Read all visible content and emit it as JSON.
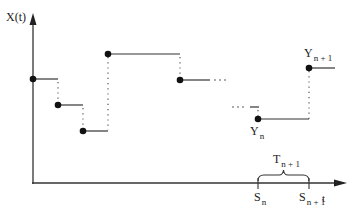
{
  "diagram": {
    "type": "step-process",
    "axes": {
      "y_label": "X(t)",
      "x_label": "t"
    },
    "colors": {
      "line": "#333333",
      "dot": "#111111",
      "dotted": "#555555"
    },
    "steps": [
      {
        "x1": 33,
        "x2": 58,
        "y": 79
      },
      {
        "x1": 58,
        "x2": 83,
        "y": 105
      },
      {
        "x1": 83,
        "x2": 108,
        "y": 131
      },
      {
        "x1": 108,
        "x2": 180,
        "y": 54
      },
      {
        "x1": 180,
        "x2": 210,
        "y": 80
      },
      {
        "x1": 250,
        "x2": 258,
        "y": 107
      },
      {
        "x1": 258,
        "x2": 309,
        "y": 119
      },
      {
        "x1": 309,
        "x2": 335,
        "y": 68
      }
    ],
    "ellipses": [
      {
        "text": "· · ·",
        "x": 213,
        "y": 80
      },
      {
        "text": "· · ·",
        "x": 232,
        "y": 107
      }
    ],
    "labels": {
      "Yn": {
        "main": "Y",
        "sub": "n"
      },
      "Yn1": {
        "main": "Y",
        "sub": "n + 1"
      },
      "Sn": {
        "main": "S",
        "sub": "n"
      },
      "Sn1": {
        "main": "S",
        "sub": "n + 1"
      },
      "Tn1": {
        "main": "T",
        "sub": "n + 1"
      }
    }
  }
}
